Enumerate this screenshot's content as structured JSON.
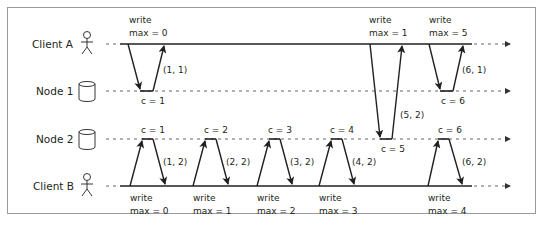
{
  "participants": [
    {
      "id": "client_a",
      "label": "Client A",
      "icon": "person-icon"
    },
    {
      "id": "node_1",
      "label": "Node 1",
      "icon": "database-icon"
    },
    {
      "id": "node_2",
      "label": "Node 2",
      "icon": "database-icon"
    },
    {
      "id": "client_b",
      "label": "Client B",
      "icon": "person-icon"
    }
  ],
  "client_a_writes": [
    {
      "line1": "write",
      "line2": "max = 0"
    },
    {
      "line1": "write",
      "line2": "max = 1"
    },
    {
      "line1": "write",
      "line2": "max = 5"
    }
  ],
  "client_b_writes": [
    {
      "line1": "write",
      "line2": "max = 0"
    },
    {
      "line1": "write",
      "line2": "max = 1"
    },
    {
      "line1": "write",
      "line2": "max = 2"
    },
    {
      "line1": "write",
      "line2": "max = 3"
    },
    {
      "line1": "write",
      "line2": "max = 4"
    }
  ],
  "node1_counters": [
    "c = 1",
    "c = 6"
  ],
  "node2_counters": [
    "c = 1",
    "c = 2",
    "c = 3",
    "c = 4",
    "c = 5",
    "c = 6"
  ],
  "responses": {
    "a1": "(1, 1)",
    "a2": "(5, 2)",
    "a3": "(6, 1)",
    "b1": "(1, 2)",
    "b2": "(2, 2)",
    "b3": "(3, 2)",
    "b4": "(4, 2)",
    "b5": "(6, 2)"
  }
}
